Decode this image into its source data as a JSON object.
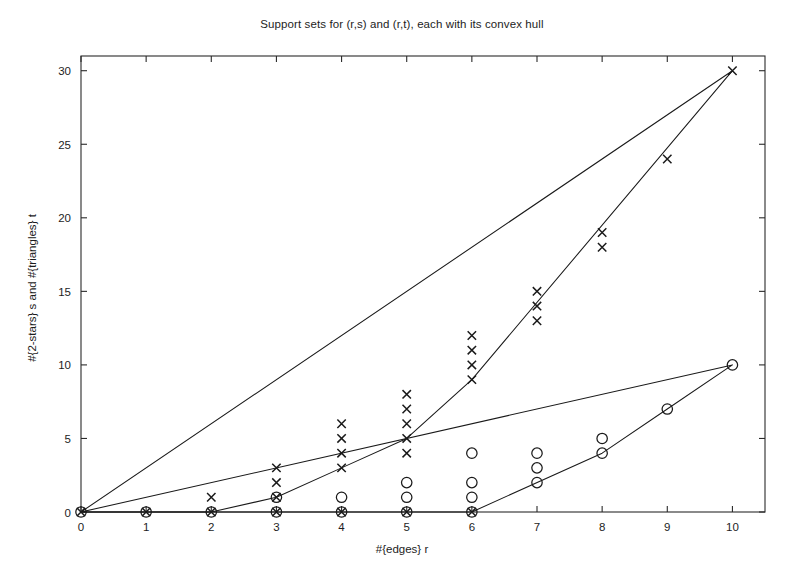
{
  "chart_data": {
    "type": "scatter",
    "title": "Support sets for (r,s) and (r,t), each with its convex hull",
    "xlabel": "#{edges} r",
    "ylabel": "#{2-stars} s and #{triangles} t",
    "xlim": [
      0,
      10.5
    ],
    "ylim": [
      0,
      31
    ],
    "xticks": [
      0,
      1,
      2,
      3,
      4,
      5,
      6,
      7,
      8,
      9,
      10
    ],
    "xticklabels": [
      "0",
      "1",
      "2",
      "3",
      "4",
      "5",
      "6",
      "7",
      "8",
      "9",
      "10"
    ],
    "yticks": [
      0,
      5,
      10,
      15,
      20,
      25,
      30
    ],
    "yticklabels": [
      "0",
      "5",
      "10",
      "15",
      "20",
      "25",
      "30"
    ],
    "grid": false,
    "legend": null,
    "marker_color": "#1a1a1a",
    "line_color": "#1a1a1a",
    "series": [
      {
        "name": "(r,s) support set",
        "marker": "x",
        "points": [
          [
            0,
            0
          ],
          [
            1,
            0
          ],
          [
            2,
            0
          ],
          [
            2,
            1
          ],
          [
            3,
            0
          ],
          [
            3,
            1
          ],
          [
            3,
            2
          ],
          [
            3,
            3
          ],
          [
            4,
            0
          ],
          [
            4,
            3
          ],
          [
            4,
            4
          ],
          [
            4,
            5
          ],
          [
            4,
            6
          ],
          [
            5,
            0
          ],
          [
            5,
            4
          ],
          [
            5,
            5
          ],
          [
            5,
            6
          ],
          [
            5,
            7
          ],
          [
            5,
            8
          ],
          [
            6,
            0
          ],
          [
            6,
            9
          ],
          [
            6,
            10
          ],
          [
            6,
            11
          ],
          [
            6,
            12
          ],
          [
            7,
            13
          ],
          [
            7,
            14
          ],
          [
            7,
            15
          ],
          [
            8,
            18
          ],
          [
            8,
            19
          ],
          [
            9,
            24
          ],
          [
            10,
            30
          ]
        ]
      },
      {
        "name": "(r,t) support set",
        "marker": "o",
        "points": [
          [
            0,
            0
          ],
          [
            1,
            0
          ],
          [
            2,
            0
          ],
          [
            3,
            0
          ],
          [
            3,
            1
          ],
          [
            4,
            0
          ],
          [
            4,
            1
          ],
          [
            5,
            0
          ],
          [
            5,
            1
          ],
          [
            5,
            2
          ],
          [
            6,
            0
          ],
          [
            6,
            1
          ],
          [
            6,
            2
          ],
          [
            6,
            4
          ],
          [
            7,
            2
          ],
          [
            7,
            3
          ],
          [
            7,
            4
          ],
          [
            8,
            4
          ],
          [
            8,
            5
          ],
          [
            9,
            7
          ],
          [
            10,
            10
          ]
        ]
      }
    ],
    "hulls": [
      {
        "name": "convex hull of (r,s) support set",
        "vertices": [
          [
            0,
            0
          ],
          [
            10,
            30
          ],
          [
            6,
            9
          ],
          [
            5,
            5
          ],
          [
            4,
            3
          ],
          [
            3,
            1
          ],
          [
            2,
            0
          ],
          [
            0,
            0
          ]
        ]
      },
      {
        "name": "convex hull of (r,t) support set",
        "vertices": [
          [
            0,
            0
          ],
          [
            10,
            10
          ],
          [
            9,
            7
          ],
          [
            8,
            4
          ],
          [
            6,
            0
          ],
          [
            0,
            0
          ]
        ]
      }
    ]
  }
}
